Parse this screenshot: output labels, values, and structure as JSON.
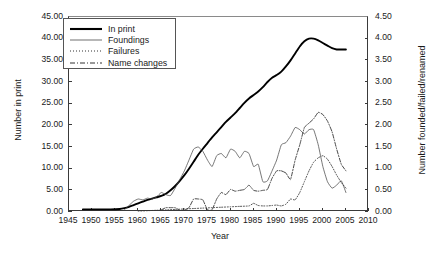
{
  "chart_data": {
    "type": "line",
    "title": "",
    "xlabel": "Year",
    "ylabel": "Number in print",
    "ylabel_right": "Number founded/failed/renamed",
    "xlim": [
      1945,
      2010
    ],
    "ylim": [
      0,
      45
    ],
    "ylim_right": [
      0.0,
      4.5
    ],
    "xticks": [
      1945,
      1950,
      1955,
      1960,
      1965,
      1970,
      1975,
      1980,
      1985,
      1990,
      1995,
      2000,
      2005,
      2010
    ],
    "yticks": [
      "0.00",
      "5.00",
      "10.00",
      "15.00",
      "20.00",
      "25.00",
      "30.00",
      "35.00",
      "40.00",
      "45.00"
    ],
    "yticks_right": [
      "0.00",
      "0.50",
      "1.00",
      "1.50",
      "2.00",
      "2.50",
      "3.00",
      "3.50",
      "4.00",
      "4.50"
    ],
    "grid": false,
    "legend_position": "upper-left",
    "legend": [
      "In print",
      "Foundings",
      "Failures",
      "Name changes"
    ],
    "series": [
      {
        "name": "In print",
        "axis": "left",
        "style": "solid-thick",
        "x": [
          1948,
          1950,
          1952,
          1954,
          1956,
          1957,
          1958,
          1959,
          1960,
          1961,
          1962,
          1963,
          1964,
          1965,
          1966,
          1967,
          1968,
          1969,
          1970,
          1971,
          1972,
          1973,
          1974,
          1975,
          1976,
          1977,
          1978,
          1979,
          1980,
          1981,
          1982,
          1983,
          1984,
          1985,
          1986,
          1987,
          1988,
          1989,
          1990,
          1991,
          1992,
          1993,
          1994,
          1995,
          1996,
          1997,
          1998,
          1999,
          2000,
          2001,
          2002,
          2003,
          2004,
          2005
        ],
        "y": [
          0.6,
          0.6,
          0.6,
          0.6,
          0.7,
          0.9,
          1.2,
          1.6,
          2.0,
          2.4,
          2.8,
          3.1,
          3.4,
          3.7,
          4.2,
          5.0,
          6.0,
          7.2,
          8.5,
          10.0,
          11.6,
          13.2,
          14.6,
          15.9,
          17.2,
          18.4,
          19.6,
          20.8,
          21.8,
          22.8,
          24.0,
          25.2,
          26.2,
          27.0,
          27.8,
          28.8,
          30.0,
          31.0,
          31.6,
          32.4,
          33.6,
          35.0,
          36.6,
          38.2,
          39.4,
          40.0,
          40.0,
          39.6,
          39.0,
          38.4,
          37.8,
          37.5,
          37.5,
          37.5
        ]
      },
      {
        "name": "Foundings",
        "axis": "right",
        "style": "solid-thin",
        "x": [
          1957,
          1958,
          1959,
          1960,
          1961,
          1962,
          1963,
          1964,
          1965,
          1966,
          1967,
          1968,
          1969,
          1970,
          1971,
          1972,
          1973,
          1974,
          1975,
          1976,
          1977,
          1978,
          1979,
          1980,
          1981,
          1982,
          1983,
          1984,
          1985,
          1986,
          1987,
          1988,
          1989,
          1990,
          1991,
          1992,
          1993,
          1994,
          1995,
          1996,
          1997,
          1998,
          1999,
          2000,
          2001,
          2002,
          2003,
          2004,
          2005
        ],
        "y": [
          0.05,
          0.15,
          0.25,
          0.3,
          0.28,
          0.32,
          0.3,
          0.35,
          0.45,
          0.4,
          0.38,
          0.55,
          0.75,
          0.95,
          1.2,
          1.45,
          1.5,
          1.4,
          1.2,
          1.05,
          1.3,
          1.35,
          1.25,
          1.45,
          1.4,
          1.25,
          1.4,
          1.35,
          1.05,
          1.1,
          0.7,
          0.72,
          0.95,
          1.2,
          1.55,
          1.6,
          1.75,
          1.95,
          1.9,
          1.8,
          1.9,
          1.9,
          1.55,
          1.05,
          0.7,
          0.55,
          0.62,
          0.72,
          0.45
        ]
      },
      {
        "name": "Failures",
        "axis": "right",
        "style": "dotted",
        "x": [
          1960,
          1962,
          1964,
          1966,
          1968,
          1970,
          1972,
          1974,
          1976,
          1978,
          1980,
          1982,
          1984,
          1985,
          1986,
          1987,
          1988,
          1989,
          1990,
          1991,
          1992,
          1993,
          1994,
          1995,
          1996,
          1997,
          1998,
          1999,
          2000,
          2001,
          2002,
          2003,
          2004,
          2005
        ],
        "y": [
          0.02,
          0.03,
          0.04,
          0.05,
          0.06,
          0.07,
          0.08,
          0.09,
          0.1,
          0.11,
          0.12,
          0.13,
          0.14,
          0.2,
          0.15,
          0.14,
          0.14,
          0.15,
          0.16,
          0.14,
          0.18,
          0.3,
          0.28,
          0.45,
          0.7,
          0.95,
          1.15,
          1.25,
          1.3,
          1.22,
          1.05,
          0.85,
          0.68,
          0.55
        ]
      },
      {
        "name": "Name changes",
        "axis": "right",
        "style": "dashdot",
        "x": [
          1965,
          1966,
          1967,
          1968,
          1969,
          1970,
          1971,
          1972,
          1973,
          1974,
          1975,
          1976,
          1977,
          1978,
          1979,
          1980,
          1981,
          1982,
          1983,
          1984,
          1985,
          1986,
          1987,
          1988,
          1989,
          1990,
          1991,
          1992,
          1993,
          1994,
          1995,
          1996,
          1997,
          1998,
          1999,
          2000,
          2001,
          2002,
          2003,
          2004,
          2005
        ],
        "y": [
          0.05,
          0.1,
          0.1,
          0.1,
          0.04,
          0.04,
          0.1,
          0.3,
          0.3,
          0.28,
          0.05,
          0.05,
          0.3,
          0.45,
          0.4,
          0.52,
          0.48,
          0.5,
          0.52,
          0.62,
          0.5,
          0.48,
          0.5,
          0.52,
          0.78,
          0.95,
          0.95,
          0.9,
          0.75,
          1.2,
          1.55,
          1.95,
          2.05,
          2.15,
          2.3,
          2.25,
          2.1,
          1.85,
          1.45,
          1.1,
          0.95
        ]
      }
    ]
  }
}
